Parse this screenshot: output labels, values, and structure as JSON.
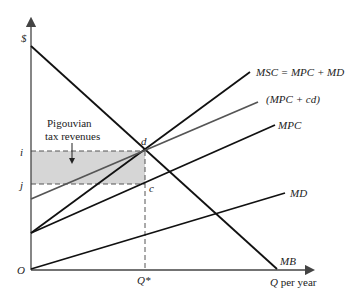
{
  "diagram": {
    "type": "economics-supply-demand",
    "axes": {
      "y_label": "$",
      "x_label_q": "Q",
      "x_label_rest": " per year",
      "origin_label": "O"
    },
    "price_levels": [
      {
        "label": "i"
      },
      {
        "label": "j"
      }
    ],
    "quantity_label": "Q*",
    "points": {
      "d": "d",
      "c": "c"
    },
    "curves": {
      "msc": "MSC = MPC + MD",
      "mpc_cd": "(MPC + cd)",
      "mpc": "MPC",
      "md": "MD",
      "mb": "MB"
    },
    "annotation": {
      "line1": "Pigouvian",
      "line2": "tax revenues"
    },
    "colors": {
      "line": "#111111",
      "gray_line": "#555555",
      "shade": "#d6d6d6",
      "axis": "#333333"
    }
  }
}
